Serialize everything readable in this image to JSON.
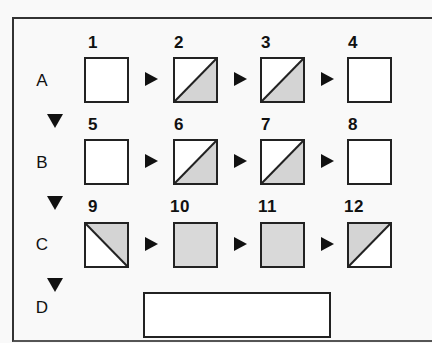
{
  "diagram": {
    "type": "sequence-puzzle",
    "colors": {
      "line": "#222222",
      "shade": "#d4d4d4",
      "background": "#f9f9f9",
      "cell_fill": "#ffffff"
    },
    "rows": [
      {
        "label": "A",
        "cells": [
          {
            "number": "1",
            "pattern": "blank"
          },
          {
            "number": "2",
            "pattern": "diag-bl-tr-shade-lower-right"
          },
          {
            "number": "3",
            "pattern": "diag-bl-tr-shade-lower-right"
          },
          {
            "number": "4",
            "pattern": "blank"
          }
        ]
      },
      {
        "label": "B",
        "cells": [
          {
            "number": "5",
            "pattern": "blank"
          },
          {
            "number": "6",
            "pattern": "diag-bl-tr-shade-lower-right"
          },
          {
            "number": "7",
            "pattern": "diag-bl-tr-shade-lower-right"
          },
          {
            "number": "8",
            "pattern": "blank"
          }
        ]
      },
      {
        "label": "C",
        "cells": [
          {
            "number": "9",
            "pattern": "diag-tl-br-shade-upper-right"
          },
          {
            "number": "10",
            "pattern": "full-shade"
          },
          {
            "number": "11",
            "pattern": "full-shade"
          },
          {
            "number": "12",
            "pattern": "diag-bl-tr-shade-upper-left"
          }
        ]
      }
    ],
    "answer_row": {
      "label": "D",
      "value": ""
    },
    "icons": {
      "row_arrow": "right-triangle-arrow-icon",
      "column_arrow": "down-triangle-arrow-icon"
    }
  }
}
